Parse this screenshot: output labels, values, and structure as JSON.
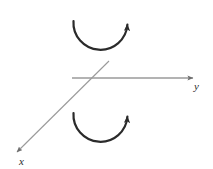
{
  "figure": {
    "background_color": "#ffffff",
    "width": 213,
    "height": 169
  },
  "axes": {
    "y_axis": {
      "label": "y",
      "color": "#9a9a9a",
      "orientation": "horizontal",
      "arrow_direction": "right",
      "start": [
        72,
        78
      ],
      "end": [
        198,
        78
      ],
      "label_position": [
        197,
        88
      ]
    },
    "x_axis": {
      "label": "x",
      "color": "#9a9a9a",
      "orientation": "diagonal",
      "arrow_direction": "lower-left",
      "start": [
        109,
        61
      ],
      "end": [
        13,
        156
      ],
      "label_position": [
        22,
        162
      ]
    }
  },
  "arcs": [
    {
      "name": "upper-rotation-arrow",
      "color": "#2b2b2b",
      "center": [
        100,
        28
      ],
      "radius": 27,
      "opening": "upward",
      "arrowhead_at": [
        128,
        12
      ],
      "arrowhead_direction": "up",
      "sweep": "counterclockwise-from-left-to-right"
    },
    {
      "name": "lower-rotation-arrow",
      "color": "#2b2b2b",
      "center": [
        100,
        120
      ],
      "radius": 27,
      "opening": "upward",
      "arrowhead_at": [
        128,
        104
      ],
      "arrowhead_direction": "up",
      "sweep": "counterclockwise-from-left-to-right"
    }
  ]
}
